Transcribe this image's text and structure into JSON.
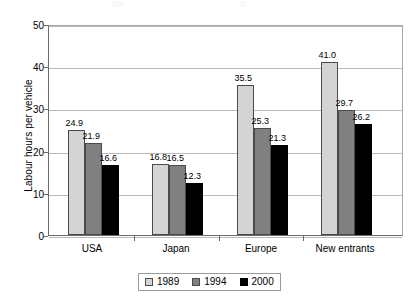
{
  "chart_data": {
    "type": "bar",
    "title": "",
    "xlabel": "",
    "ylabel": "Labour hours per vehicle",
    "ylim": [
      0,
      50
    ],
    "yticks": [
      0,
      10,
      20,
      30,
      40,
      50
    ],
    "ytick_labels": [
      "0",
      "10",
      "20",
      "30",
      "40",
      "50"
    ],
    "grid": "horizontal",
    "legend_position": "bottom",
    "categories": [
      "USA",
      "Japan",
      "Europe",
      "New entrants"
    ],
    "series": [
      {
        "name": "1989",
        "color": "#d4d4d4",
        "values": [
          24.9,
          16.8,
          35.5,
          41.0
        ],
        "labels": [
          "24.9",
          "16.8",
          "35.5",
          "41.0"
        ]
      },
      {
        "name": "1994",
        "color": "#808080",
        "values": [
          21.9,
          16.5,
          25.3,
          29.7
        ],
        "labels": [
          "21.9",
          "16.5",
          "25.3",
          "29.7"
        ]
      },
      {
        "name": "2000",
        "color": "#000000",
        "values": [
          16.6,
          12.3,
          21.3,
          26.2
        ],
        "labels": [
          "16.6",
          "12.3",
          "21.3",
          "26.2"
        ]
      }
    ]
  },
  "legend": {
    "entries": [
      "1989",
      "1994",
      "2000"
    ]
  }
}
